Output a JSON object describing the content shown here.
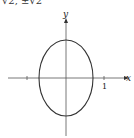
{
  "caption": "√2, ±√2",
  "graph": {
    "x_label": "x",
    "y_label": "y",
    "tick_label_x": "1",
    "curve": "ellipse",
    "colors": {
      "axis": "#555555",
      "curve": "#333333"
    }
  }
}
